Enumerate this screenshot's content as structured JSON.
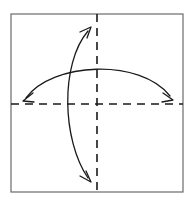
{
  "figure": {
    "background_color": "#ffffff",
    "width": 189,
    "height": 206
  },
  "frame": {
    "name": "square-outline",
    "x": 11,
    "y": 14,
    "width": 172,
    "height": 178,
    "stroke_color": "#6b6b6b",
    "stroke_width": 1.2,
    "fill": "none"
  },
  "axes": {
    "stroke_color": "#1a1a1a",
    "stroke_width": 1.6,
    "dash_pattern": "8 6",
    "horizontal": {
      "name": "horizontal-dashed-axis",
      "x1": 11,
      "y1": 104,
      "x2": 183,
      "y2": 104
    },
    "vertical": {
      "name": "vertical-dashed-axis",
      "x1": 97,
      "y1": 14,
      "x2": 97,
      "y2": 192
    },
    "center": {
      "x": 97,
      "y": 104
    }
  },
  "arrows": [
    {
      "name": "horizontal-curved-arrow",
      "description": "double-headed arc bulging upward, spanning left to right across the horizontal axis",
      "stroke_color": "#1a1a1a",
      "stroke_width": 1.3,
      "double_headed": true,
      "path": "M 26,98 C 52,62 140,58 170,96",
      "apex": {
        "x": 100,
        "y": 67
      },
      "start_point": {
        "x": 26,
        "y": 98
      },
      "end_point": {
        "x": 170,
        "y": 96
      },
      "heads": [
        {
          "name": "left-arrowhead",
          "points_toward": "down-left",
          "tip": {
            "x": 23,
            "y": 101
          },
          "path": "M 33,93 L 23,101 L 34,102"
        },
        {
          "name": "right-arrowhead",
          "points_toward": "down-right",
          "tip": {
            "x": 173,
            "y": 100
          },
          "path": "M 163,93 L 173,100 L 162,102"
        }
      ]
    },
    {
      "name": "vertical-curved-arrow",
      "description": "double-headed arc bulging leftward, spanning bottom to top across the vertical axis",
      "stroke_color": "#1a1a1a",
      "stroke_width": 1.3,
      "double_headed": true,
      "path": "M 88,31 C 60,64 62,140 88,178",
      "apex": {
        "x": 67,
        "y": 105
      },
      "start_point": {
        "x": 88,
        "y": 31
      },
      "end_point": {
        "x": 88,
        "y": 178
      },
      "heads": [
        {
          "name": "top-arrowhead",
          "points_toward": "up-right",
          "tip": {
            "x": 91,
            "y": 27
          },
          "path": "M 80,32 L 91,27 L 87,38"
        },
        {
          "name": "bottom-arrowhead",
          "points_toward": "down-right",
          "tip": {
            "x": 91,
            "y": 182
          },
          "path": "M 80,176 L 91,182 L 86,171"
        }
      ]
    }
  ]
}
